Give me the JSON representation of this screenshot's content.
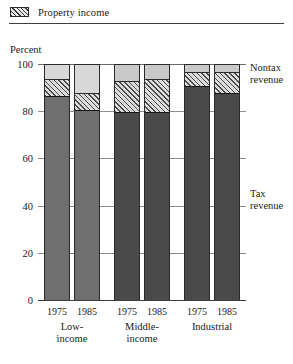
{
  "legend": {
    "swatch_name": "property-income-swatch",
    "label": "Property income"
  },
  "axis": {
    "ylabel": "Percent",
    "yticks": [
      "0",
      "20",
      "40",
      "60",
      "80",
      "100"
    ]
  },
  "callouts": {
    "nontax_line1": "Nontax",
    "nontax_line2": "revenue",
    "tax_line1": "Tax",
    "tax_line2": "revenue"
  },
  "groups": [
    {
      "name": "Low-income",
      "line1": "Low-",
      "line2": "income"
    },
    {
      "name": "Middle-income",
      "line1": "Middle-",
      "line2": "income"
    },
    {
      "name": "Industrial",
      "line1": "Industrial",
      "line2": ""
    }
  ],
  "years": [
    "1975",
    "1985",
    "1975",
    "1985",
    "1975",
    "1985"
  ],
  "colors": {
    "tax_light": "#6f6f6f",
    "tax_dark": "#4a4a4a",
    "property_hatch": "#4a4a4a",
    "property_bg": "#dcdcdc",
    "nontax": "#c9c9c9",
    "gridline": "#8e8e8e",
    "outline": "#2b2b2b"
  },
  "chart_data": {
    "type": "bar",
    "title": "",
    "subtitle": "",
    "xlabel": "",
    "ylabel": "Percent",
    "ylim": [
      0,
      100
    ],
    "yticks": [
      0,
      20,
      40,
      60,
      80,
      100
    ],
    "grid": true,
    "stacked": true,
    "legend_position": "top-left",
    "categories": [
      "Low-income 1975",
      "Low-income 1985",
      "Middle-income 1975",
      "Middle-income 1985",
      "Industrial 1975",
      "Industrial 1985"
    ],
    "group_labels": [
      "Low-income",
      "Middle-income",
      "Industrial"
    ],
    "x_tick_labels": [
      "1975",
      "1985",
      "1975",
      "1985",
      "1975",
      "1985"
    ],
    "series": [
      {
        "name": "Tax revenue",
        "values": [
          87,
          81,
          80,
          80,
          91,
          88
        ]
      },
      {
        "name": "Property income",
        "values": [
          7,
          7,
          13,
          14,
          6,
          9
        ]
      },
      {
        "name": "Nontax revenue",
        "values": [
          6,
          12,
          7,
          6,
          3,
          3
        ]
      }
    ],
    "annotations": [
      "Nontax revenue",
      "Tax revenue"
    ]
  }
}
